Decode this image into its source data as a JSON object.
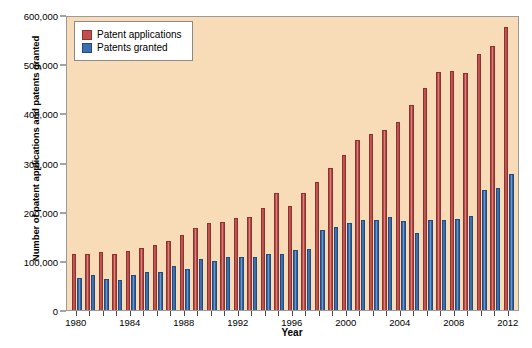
{
  "chart_data": {
    "type": "bar",
    "title": "",
    "xlabel": "Year",
    "ylabel": "Number of patent applications and patents granted",
    "ylim": [
      0,
      600000
    ],
    "ytick_values": [
      0,
      100000,
      200000,
      300000,
      400000,
      500000,
      600000
    ],
    "ytick_labels": [
      "0",
      "100,000",
      "200,000",
      "300,000",
      "400,000",
      "500,000",
      "600,000"
    ],
    "xtick_labels": [
      "1980",
      "1984",
      "1988",
      "1992",
      "1996",
      "2000",
      "2004",
      "2008",
      "2012"
    ],
    "grid": false,
    "legend_position": "upper-left",
    "categories": [
      1980,
      1981,
      1982,
      1983,
      1984,
      1985,
      1986,
      1987,
      1988,
      1989,
      1990,
      1991,
      1992,
      1993,
      1994,
      1995,
      1996,
      1997,
      1998,
      1999,
      2000,
      2001,
      2002,
      2003,
      2004,
      2005,
      2006,
      2007,
      2008,
      2009,
      2010,
      2011,
      2012
    ],
    "series": [
      {
        "name": "Patent applications",
        "color": "#c0504d",
        "values": [
          113000,
          114000,
          118000,
          113000,
          121000,
          127000,
          133000,
          140000,
          152000,
          166000,
          176000,
          178000,
          187000,
          189000,
          207000,
          237000,
          212000,
          238000,
          261000,
          289000,
          316000,
          346000,
          357000,
          367000,
          382000,
          417000,
          452000,
          485000,
          486000,
          483000,
          520000,
          536000,
          576000
        ]
      },
      {
        "name": "Patents granted",
        "color": "#3a6fb0",
        "values": [
          66000,
          71000,
          64000,
          62000,
          72000,
          77000,
          77000,
          89000,
          84000,
          103000,
          99000,
          107000,
          108000,
          107000,
          113000,
          114000,
          122000,
          124000,
          163000,
          169000,
          176000,
          184000,
          184000,
          189000,
          181000,
          157000,
          183000,
          184000,
          185000,
          192000,
          244000,
          248000,
          276000
        ]
      }
    ]
  },
  "legend": {
    "items": [
      {
        "label": "Patent applications",
        "swatch": "apps"
      },
      {
        "label": "Patents granted",
        "swatch": "granted"
      }
    ]
  },
  "axes": {
    "y_title": "Number of patent applications and patents granted",
    "x_title": "Year"
  }
}
